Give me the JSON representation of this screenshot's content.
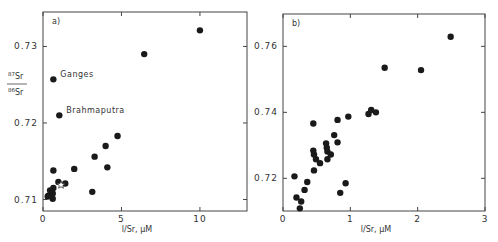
{
  "chart_data": [
    {
      "type": "scatter",
      "panel_label": "a)",
      "title": "",
      "xlabel": "l/Sr, μM",
      "ylabel_numerator": "87Sr",
      "ylabel_denominator": "86Sr",
      "xlim": [
        0,
        13
      ],
      "ylim": [
        0.7085,
        0.7345
      ],
      "xticks": [
        0,
        5,
        10
      ],
      "xtick_labels": [
        "0",
        "5",
        "10"
      ],
      "yticks": [
        0.71,
        0.72,
        0.73
      ],
      "ytick_labels": [
        "0.71",
        "0.72",
        "0.73"
      ],
      "grid": false,
      "legend": null,
      "annotations": [
        {
          "text": "Ganges",
          "x": 0.66,
          "y": 0.7257
        },
        {
          "text": "Brahmaputra",
          "x": 1.04,
          "y": 0.721
        }
      ],
      "series": [
        {
          "name": "rivers",
          "marker": "filled-circle",
          "points": [
            {
              "x": 10.0,
              "y": 0.7321
            },
            {
              "x": 6.45,
              "y": 0.729
            },
            {
              "x": 0.66,
              "y": 0.7257,
              "label": "Ganges"
            },
            {
              "x": 1.04,
              "y": 0.721,
              "label": "Brahmaputra"
            },
            {
              "x": 4.75,
              "y": 0.7183
            },
            {
              "x": 3.99,
              "y": 0.717
            },
            {
              "x": 3.29,
              "y": 0.7156
            },
            {
              "x": 4.1,
              "y": 0.7142
            },
            {
              "x": 1.99,
              "y": 0.714
            },
            {
              "x": 0.66,
              "y": 0.7138
            },
            {
              "x": 0.98,
              "y": 0.7123
            },
            {
              "x": 1.42,
              "y": 0.7121
            },
            {
              "x": 0.66,
              "y": 0.7115
            },
            {
              "x": 0.45,
              "y": 0.7112
            },
            {
              "x": 3.14,
              "y": 0.711
            },
            {
              "x": 0.34,
              "y": 0.7105
            },
            {
              "x": 0.62,
              "y": 0.7101
            },
            {
              "x": 0.3,
              "y": 0.7104
            },
            {
              "x": 0.62,
              "y": 0.7108
            }
          ]
        },
        {
          "name": "mean",
          "marker": "open-star",
          "points": [
            {
              "x": 1.15,
              "y": 0.7119
            }
          ]
        }
      ]
    },
    {
      "type": "scatter",
      "panel_label": "b)",
      "title": "",
      "xlabel": "l/Sr, μM",
      "xlim": [
        0,
        3
      ],
      "ylim": [
        0.7101,
        0.7698
      ],
      "xticks": [
        0,
        1,
        2,
        3
      ],
      "xtick_labels": [
        "0",
        "1",
        "2",
        "3"
      ],
      "yticks": [
        0.72,
        0.74,
        0.76
      ],
      "ytick_labels": [
        "0.72",
        "0.74",
        "0.76"
      ],
      "grid": false,
      "legend": null,
      "series": [
        {
          "name": "samples",
          "marker": "filled-circle",
          "points": [
            {
              "x": 2.49,
              "y": 0.7629
            },
            {
              "x": 1.51,
              "y": 0.7535
            },
            {
              "x": 2.05,
              "y": 0.7528
            },
            {
              "x": 1.27,
              "y": 0.7395
            },
            {
              "x": 1.31,
              "y": 0.7407
            },
            {
              "x": 1.38,
              "y": 0.74
            },
            {
              "x": 0.97,
              "y": 0.7387
            },
            {
              "x": 0.81,
              "y": 0.7377
            },
            {
              "x": 0.45,
              "y": 0.7366
            },
            {
              "x": 0.76,
              "y": 0.7331
            },
            {
              "x": 0.81,
              "y": 0.7309
            },
            {
              "x": 0.64,
              "y": 0.7306
            },
            {
              "x": 0.65,
              "y": 0.7293
            },
            {
              "x": 0.45,
              "y": 0.7284
            },
            {
              "x": 0.66,
              "y": 0.7281
            },
            {
              "x": 0.46,
              "y": 0.7272
            },
            {
              "x": 0.71,
              "y": 0.7272
            },
            {
              "x": 0.49,
              "y": 0.7258
            },
            {
              "x": 0.66,
              "y": 0.7258
            },
            {
              "x": 0.55,
              "y": 0.7246
            },
            {
              "x": 0.46,
              "y": 0.7224
            },
            {
              "x": 0.17,
              "y": 0.7206
            },
            {
              "x": 0.36,
              "y": 0.7189
            },
            {
              "x": 0.93,
              "y": 0.7185
            },
            {
              "x": 0.32,
              "y": 0.7165
            },
            {
              "x": 0.85,
              "y": 0.7156
            },
            {
              "x": 0.2,
              "y": 0.7142
            },
            {
              "x": 0.27,
              "y": 0.713
            },
            {
              "x": 0.25,
              "y": 0.7109
            }
          ]
        }
      ]
    }
  ],
  "layout": {
    "panels": [
      {
        "left": 43,
        "top": 12,
        "right": 247,
        "bottom": 211
      },
      {
        "left": 283,
        "top": 14,
        "right": 485,
        "bottom": 211
      }
    ],
    "colors": {
      "marker": "#1a1a1a",
      "axis": "#444444",
      "text": "#333333"
    }
  }
}
